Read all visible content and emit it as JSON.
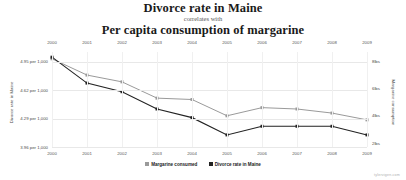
{
  "header": {
    "title_top": "Divorce rate in Maine",
    "connector": "correlates with",
    "title_bottom": "Per capita consumption of margarine"
  },
  "watermark": "tylervigen.com",
  "legend": {
    "position": "bottom-center",
    "items": [
      {
        "label": "Margarine consumed",
        "color": "#9a9a9a",
        "marker": "square"
      },
      {
        "label": "Divorce rate in Maine",
        "color": "#222222",
        "marker": "square"
      }
    ]
  },
  "axes": {
    "x_top_labels": [
      "2000",
      "2001",
      "2002",
      "2003",
      "2004",
      "2005",
      "2006",
      "2007",
      "2008",
      "2009"
    ],
    "x_bottom_labels": [
      "2000",
      "2001",
      "2002",
      "2003",
      "2004",
      "2005",
      "2006",
      "2007",
      "2008",
      "2009"
    ],
    "y_left_title": "Divorce rate in Maine",
    "y_left_labels": [
      "4.95 per 1,000",
      "4.62 per 1,000",
      "4.29 per 1,000",
      "3.96 per 1,000"
    ],
    "y_right_title": "Margarine consumption",
    "y_right_labels": [
      "8lbs",
      "6lbs",
      "4lbs",
      "2lbs"
    ]
  },
  "chart_data": {
    "type": "line",
    "title": "Divorce rate in Maine correlates with Per capita consumption of margarine",
    "subtitle": "correlates with",
    "xlabel": "",
    "ylabel": "Divorce rate in Maine",
    "y2label": "Margarine consumption",
    "grid": true,
    "legend_position": "bottom-center",
    "x": [
      2000,
      2001,
      2002,
      2003,
      2004,
      2005,
      2006,
      2007,
      2008,
      2009
    ],
    "xtick_labels": [
      "2000",
      "2001",
      "2002",
      "2003",
      "2004",
      "2005",
      "2006",
      "2007",
      "2008",
      "2009"
    ],
    "ylim": [
      3.96,
      5.06
    ],
    "ytick_values": [
      4.95,
      4.62,
      4.29,
      3.96
    ],
    "ytick_labels": [
      "4.95 per 1,000",
      "4.62 per 1,000",
      "4.29 per 1,000",
      "3.96 per 1,000"
    ],
    "y2lim": [
      1.7,
      8.7
    ],
    "y2tick_values": [
      8,
      6,
      4,
      2
    ],
    "y2tick_labels": [
      "8lbs",
      "6lbs",
      "4lbs",
      "2lbs"
    ],
    "series": [
      {
        "name": "Divorce rate in Maine",
        "axis": "left",
        "color": "#222222",
        "units": "per 1,000",
        "values": [
          5.0,
          4.7,
          4.6,
          4.4,
          4.3,
          4.1,
          4.2,
          4.2,
          4.2,
          4.1
        ]
      },
      {
        "name": "Margarine consumed",
        "axis": "right",
        "color": "#9a9a9a",
        "units": "lbs",
        "values": [
          8.2,
          7.0,
          6.5,
          5.3,
          5.2,
          4.0,
          4.6,
          4.5,
          4.2,
          3.7
        ]
      }
    ]
  }
}
